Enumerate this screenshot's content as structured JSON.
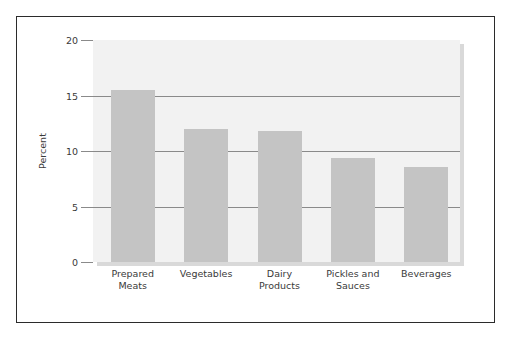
{
  "figure": {
    "background_color": "#ffffff",
    "frame_color": "#2b2b2b",
    "panel_color": "#f2f2f2",
    "bar_color": "#c4c4c4",
    "grid_color": "#8a8a8a",
    "text_color": "#3a3a3a"
  },
  "chart_data": {
    "type": "bar",
    "title": "",
    "subtitle": "",
    "xlabel": "",
    "ylabel": "Percent",
    "categories": [
      "Prepared\nMeats",
      "Vegetables",
      "Dairy\nProducts",
      "Pickles and\nSauces",
      "Beverages"
    ],
    "values": [
      15.5,
      12.0,
      11.8,
      9.4,
      8.6
    ],
    "ylim": [
      0,
      20
    ],
    "yticks": [
      0,
      5,
      10,
      15,
      20
    ],
    "ytick_labels": [
      "0",
      "5",
      "10",
      "15",
      "20"
    ],
    "gridlines_at": [
      5,
      10,
      15
    ],
    "grid": true,
    "legend": "none",
    "orientation": "vertical"
  }
}
